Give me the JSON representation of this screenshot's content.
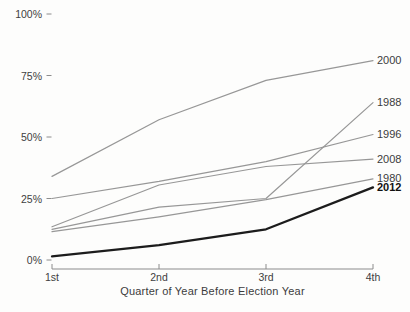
{
  "chart_data": {
    "type": "line",
    "x_axis": {
      "categories": [
        "1st",
        "2nd",
        "3rd",
        "4th"
      ],
      "title": "Quarter of Year Before Election Year"
    },
    "y_axis": {
      "ticks": [
        {
          "value": 0,
          "label": "0%"
        },
        {
          "value": 25,
          "label": "25%"
        },
        {
          "value": 50,
          "label": "50%"
        },
        {
          "value": 75,
          "label": "75%"
        },
        {
          "value": 100,
          "label": "100%"
        }
      ],
      "ylim": [
        0,
        100
      ]
    },
    "series": [
      {
        "name": "2000",
        "values": [
          34,
          57,
          73,
          81
        ],
        "emphasis": false
      },
      {
        "name": "1988",
        "values": [
          12.5,
          21.5,
          25,
          64
        ],
        "emphasis": false
      },
      {
        "name": "1996",
        "values": [
          25,
          32,
          40,
          51
        ],
        "emphasis": false
      },
      {
        "name": "2008",
        "values": [
          13.5,
          30.5,
          38,
          41
        ],
        "emphasis": false
      },
      {
        "name": "1980",
        "values": [
          11.5,
          17.5,
          24.5,
          33
        ],
        "emphasis": false
      },
      {
        "name": "2012",
        "values": [
          1.5,
          6,
          12.5,
          29.5
        ],
        "emphasis": true
      }
    ],
    "legend_position": "right-edge-labels",
    "grid": "off",
    "colors": {
      "series_line": "#979797",
      "emphasis_line": "#1c1c1c",
      "axis_line": "#8c8c8c",
      "tick_label": "#404040",
      "series_label": "#3c3c3c",
      "emphasis_label": "#111111"
    }
  }
}
